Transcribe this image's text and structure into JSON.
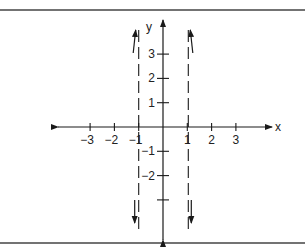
{
  "chart_data": {
    "type": "line",
    "title": "",
    "xlabel": "x",
    "ylabel": "y",
    "xlim": [
      -4.4,
      4.6
    ],
    "ylim": [
      -4.6,
      4.4
    ],
    "x_ticks": [
      -3,
      -2,
      -1,
      1,
      2,
      3
    ],
    "x_tick_labels": [
      "−3",
      "−2",
      "−1",
      "1",
      "2",
      "3"
    ],
    "y_ticks": [
      3,
      2,
      1,
      -1,
      -2,
      -3
    ],
    "y_tick_labels": [
      "3",
      "2",
      "1",
      "−1",
      "−2",
      ""
    ],
    "asymptotes": [
      {
        "x": -1,
        "style": "dashed"
      },
      {
        "x": 1,
        "style": "dashed"
      }
    ],
    "behavior_arrows": [
      {
        "near_x": -1,
        "side": "left",
        "direction": "up"
      },
      {
        "near_x": 1,
        "side": "right",
        "direction": "up"
      },
      {
        "near_x": -1,
        "side": "left",
        "direction": "down"
      },
      {
        "near_x": 1,
        "side": "right",
        "direction": "down"
      }
    ],
    "grid": false,
    "legend": "none"
  },
  "colors": {
    "ink": "#1a1a1a",
    "frame": "#444444",
    "background": "#ffffff"
  }
}
